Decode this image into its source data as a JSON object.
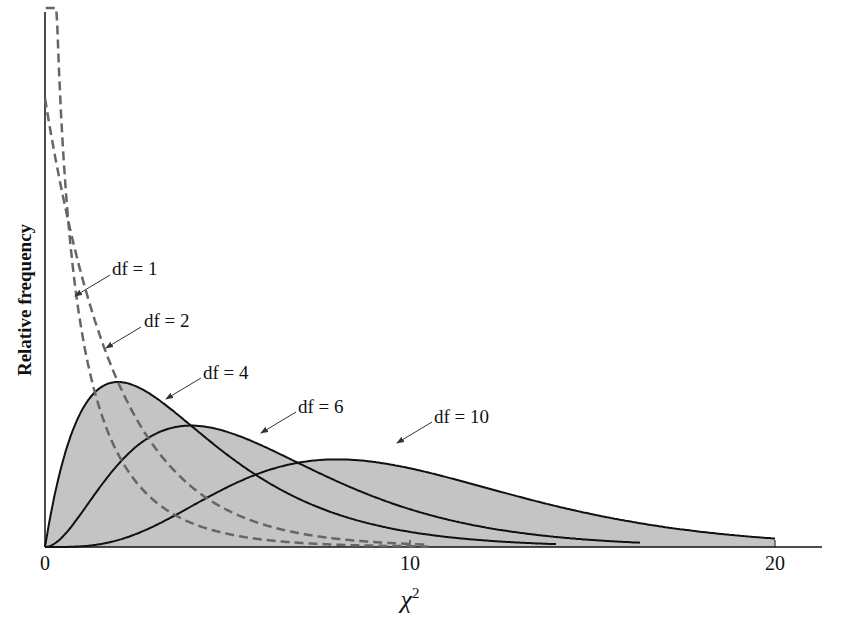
{
  "chart_data": {
    "type": "line",
    "title": "",
    "xlabel": "χ²",
    "ylabel": "Relative frequency",
    "xlim": [
      0,
      21.3
    ],
    "x_ticks": [
      "0",
      "10",
      "20"
    ],
    "grid": false,
    "legend": "none (curves labeled by arrow annotations)",
    "fill": "area under df=4, df=6, df=10 curves shaded gray",
    "series": [
      {
        "name": "df = 1",
        "style": "dashed",
        "df": 1
      },
      {
        "name": "df = 2",
        "style": "dashed",
        "df": 2
      },
      {
        "name": "df = 4",
        "style": "solid",
        "df": 4,
        "mode": 2
      },
      {
        "name": "df = 6",
        "style": "solid",
        "df": 6,
        "mode": 4
      },
      {
        "name": "df = 10",
        "style": "solid",
        "df": 10,
        "mode": 8
      }
    ],
    "annotations": [
      "df = 1",
      "df = 2",
      "df = 4",
      "df = 6",
      "df = 10"
    ]
  },
  "labels": {
    "ylabel": "Relative frequency",
    "xlabel_base": "χ",
    "xlabel_sup": "2",
    "ticks": [
      "0",
      "10",
      "20"
    ],
    "annotations": [
      "df = 1",
      "df = 2",
      "df = 4",
      "df = 6",
      "df = 10"
    ]
  },
  "colors": {
    "fill": "#c4c4c4",
    "solid": "#111111",
    "dashed": "#666666"
  }
}
